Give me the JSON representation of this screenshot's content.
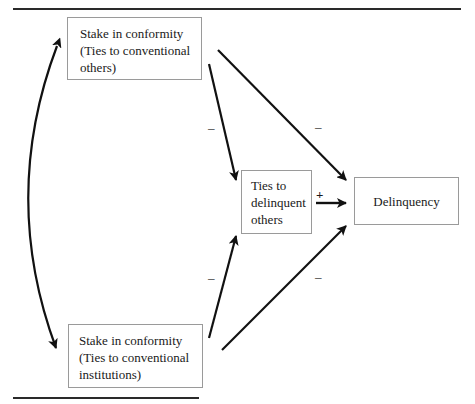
{
  "diagram": {
    "nodes": {
      "stake_others": {
        "lines": [
          "Stake in conformity",
          "(Ties to conventional",
          "others)"
        ]
      },
      "stake_institutions": {
        "lines": [
          "Stake in conformity",
          "(Ties to conventional",
          "institutions)"
        ]
      },
      "ties_delinquent": {
        "lines": [
          "Ties to",
          "delinquent",
          "others"
        ]
      },
      "delinquency": {
        "label": "Delinquency"
      }
    },
    "edges": [
      {
        "from": "stake_others",
        "to": "ties_delinquent",
        "sign": "–"
      },
      {
        "from": "stake_others",
        "to": "delinquency",
        "sign": "–"
      },
      {
        "from": "stake_institutions",
        "to": "ties_delinquent",
        "sign": "–"
      },
      {
        "from": "stake_institutions",
        "to": "delinquency",
        "sign": "–"
      },
      {
        "from": "ties_delinquent",
        "to": "delinquency",
        "sign": "+"
      },
      {
        "from": "stake_others",
        "to": "stake_institutions",
        "sign": "",
        "bidirectional": true
      }
    ],
    "colors": {
      "line": "#111111",
      "box_border": "#9a9a9a",
      "rule": "#2a2a2a"
    }
  }
}
